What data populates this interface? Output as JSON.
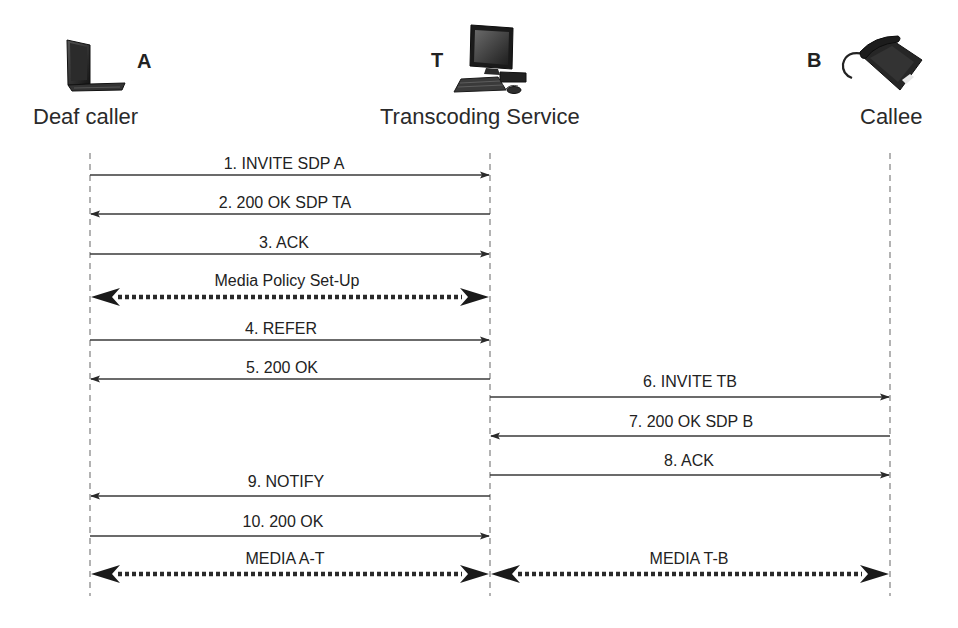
{
  "participants": {
    "a": {
      "letter": "A",
      "label": "Deaf caller",
      "icon": "laptop-icon",
      "x": 90
    },
    "t": {
      "letter": "T",
      "label": "Transcoding Service",
      "icon": "desktop-computer-icon",
      "x": 490
    },
    "b": {
      "letter": "B",
      "label": "Callee",
      "icon": "telephone-icon",
      "x": 890
    }
  },
  "messages": [
    {
      "label": "1. INVITE SDP A",
      "from": "A",
      "to": "T",
      "y": 175,
      "style": "solid"
    },
    {
      "label": "2. 200 OK SDP TA",
      "from": "T",
      "to": "A",
      "y": 214,
      "style": "solid"
    },
    {
      "label": "3. ACK",
      "from": "A",
      "to": "T",
      "y": 254,
      "style": "solid"
    },
    {
      "label": "Media Policy Set-Up",
      "from": "A",
      "to": "T",
      "y": 297,
      "style": "dotted-bidirectional"
    },
    {
      "label": "4. REFER",
      "from": "A",
      "to": "T",
      "y": 340,
      "style": "solid"
    },
    {
      "label": "5. 200 OK",
      "from": "T",
      "to": "A",
      "y": 379,
      "style": "solid"
    },
    {
      "label": "6. INVITE TB",
      "from": "T",
      "to": "B",
      "y": 397,
      "style": "solid"
    },
    {
      "label": "7. 200 OK SDP B",
      "from": "B",
      "to": "T",
      "y": 436,
      "style": "solid"
    },
    {
      "label": "8. ACK",
      "from": "T",
      "to": "B",
      "y": 475,
      "style": "solid"
    },
    {
      "label": "9. NOTIFY",
      "from": "T",
      "to": "A",
      "y": 496,
      "style": "solid"
    },
    {
      "label": "10. 200 OK",
      "from": "A",
      "to": "T",
      "y": 536,
      "style": "solid"
    },
    {
      "label": "MEDIA A-T",
      "from": "A",
      "to": "T",
      "y": 574,
      "style": "dotted-bidirectional"
    },
    {
      "label": "MEDIA T-B",
      "from": "T",
      "to": "B",
      "y": 574,
      "style": "dotted-bidirectional"
    }
  ],
  "colors": {
    "line": "#3a3a3a",
    "lifeline": "#777777",
    "text": "#222222"
  }
}
